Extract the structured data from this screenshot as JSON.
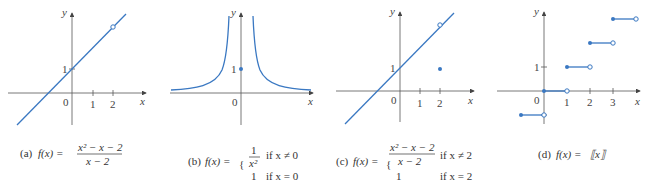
{
  "colors": {
    "curve": "#3a78c2",
    "axis": "#555555",
    "text": "#333333"
  },
  "graphs": [
    {
      "id": "a",
      "caption_prefix": "(a)",
      "caption_fx": "f(x) =",
      "numerator": "x² − x − 2",
      "denominator": "x − 2",
      "axis_x": "x",
      "axis_y": "y",
      "origin": "0",
      "xticks": [
        "1",
        "2"
      ],
      "yticks": [
        "1"
      ],
      "description": "Line y = x + 1 with open circle (hole) at (2, 3)"
    },
    {
      "id": "b",
      "caption_prefix": "(b)",
      "caption_fx": "f(x) =",
      "case1_num": "1",
      "case1_den": "x²",
      "case1_cond": "if x ≠ 0",
      "case2_val": "1",
      "case2_cond": "if x = 0",
      "axis_x": "x",
      "axis_y": "y",
      "origin": "0",
      "yticks": [
        "1"
      ],
      "description": "y = 1/x² with isolated filled point at (0, 1)"
    },
    {
      "id": "c",
      "caption_prefix": "(c)",
      "caption_fx": "f(x) =",
      "case1_num": "x² − x − 2",
      "case1_den": "x − 2",
      "case1_cond": "if x ≠ 2",
      "case2_val": "1",
      "case2_cond": "if x = 2",
      "axis_x": "x",
      "axis_y": "y",
      "origin": "0",
      "xticks": [
        "1",
        "2"
      ],
      "yticks": [
        "1"
      ],
      "description": "Line y = x + 1 with hole at (2, 3) and filled point at (2, 1)"
    },
    {
      "id": "d",
      "caption_prefix": "(d)",
      "caption_fx": "f(x) =",
      "caption_expr": "⟦x⟧",
      "axis_x": "x",
      "axis_y": "y",
      "origin": "0",
      "xticks": [
        "1",
        "2",
        "3"
      ],
      "yticks": [
        "1"
      ],
      "description": "Greatest integer (floor) step function, filled left endpoints and open right endpoints"
    }
  ]
}
